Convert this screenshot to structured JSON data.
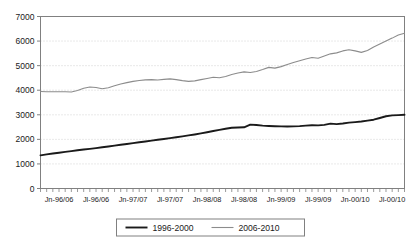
{
  "chart_data": {
    "type": "line",
    "title": "",
    "xlabel": "",
    "ylabel": "",
    "ylim": [
      0,
      7000
    ],
    "ytick_step": 1000,
    "yticks": [
      "0",
      "1000",
      "2000",
      "3000",
      "4000",
      "5000",
      "6000",
      "7000"
    ],
    "grid": true,
    "grid_style": "dotted",
    "grid_color": "#c8c8c8",
    "axis_color": "#808080",
    "legend_position": "bottom-center",
    "x_tick_count": 60,
    "x_tick_interval": "monthly",
    "xtick_labels": [
      "Jn-96/06",
      "Jl-96/06",
      "Jn-97/07",
      "Jl-97/07",
      "Jn-98/08",
      "Jl-98/08",
      "Jn-99/09",
      "Jl-99/09",
      "Jn-00/10",
      "Jl-00/10"
    ],
    "xtick_label_positions": [
      0,
      6,
      12,
      18,
      24,
      30,
      36,
      42,
      48,
      54
    ],
    "series": [
      {
        "name": "1996-2000",
        "color": "#1a1a1a",
        "width": 1.9,
        "values": [
          1350,
          1390,
          1425,
          1455,
          1490,
          1520,
          1555,
          1585,
          1615,
          1645,
          1680,
          1710,
          1745,
          1780,
          1810,
          1845,
          1880,
          1915,
          1950,
          1985,
          2015,
          2050,
          2085,
          2120,
          2160,
          2200,
          2245,
          2290,
          2340,
          2385,
          2430,
          2470,
          2480,
          2490,
          2600,
          2585,
          2560,
          2545,
          2535,
          2530,
          2525,
          2530,
          2540,
          2560,
          2575,
          2570,
          2590,
          2640,
          2620,
          2645,
          2680,
          2700,
          2725,
          2760,
          2800,
          2870,
          2940,
          2975,
          2985,
          3000
        ]
      },
      {
        "name": "2006-2010",
        "color": "#8c8c8c",
        "width": 1.1,
        "values": [
          3950,
          3940,
          3935,
          3940,
          3935,
          3930,
          3990,
          4080,
          4130,
          4110,
          4060,
          4100,
          4180,
          4250,
          4310,
          4360,
          4395,
          4420,
          4430,
          4415,
          4440,
          4460,
          4430,
          4390,
          4360,
          4380,
          4430,
          4480,
          4530,
          4510,
          4560,
          4640,
          4700,
          4745,
          4720,
          4760,
          4840,
          4930,
          4900,
          4960,
          5050,
          5130,
          5200,
          5270,
          5330,
          5300,
          5390,
          5480,
          5520,
          5600,
          5650,
          5600,
          5540,
          5620,
          5760,
          5880,
          6000,
          6120,
          6250,
          6320
        ]
      }
    ]
  },
  "legend": {
    "entries": [
      {
        "label": "1996-2000"
      },
      {
        "label": "2006-2010"
      }
    ]
  }
}
